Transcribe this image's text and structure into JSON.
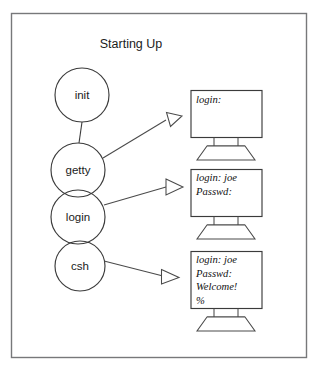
{
  "figure": {
    "title": "Starting Up",
    "background_color": "#ffffff",
    "frame_color": "#77787a",
    "stroke_color": "#3b3b3b"
  },
  "process_chain": {
    "nodes": [
      {
        "id": "init",
        "label": "init",
        "cx": 82,
        "cy": 95,
        "r": 27
      },
      {
        "id": "getty",
        "label": "getty",
        "cx": 78,
        "cy": 170,
        "r": 27
      },
      {
        "id": "login",
        "label": "login",
        "cx": 78,
        "cy": 217,
        "r": 27
      },
      {
        "id": "csh",
        "label": "csh",
        "cx": 80,
        "cy": 266,
        "r": 25
      }
    ],
    "connector": {
      "from": "init",
      "to": "getty"
    }
  },
  "terminals": [
    {
      "id": "terminal-login-prompt",
      "source_node": "getty",
      "lines": [
        "login:"
      ]
    },
    {
      "id": "terminal-password-prompt",
      "source_node": "login",
      "lines": [
        "login: joe",
        "Passwd:"
      ]
    },
    {
      "id": "terminal-shell-prompt",
      "source_node": "csh",
      "lines": [
        "login: joe",
        "Passwd:",
        "Welcome!",
        "%"
      ]
    }
  ],
  "arrows": [
    {
      "id": "arrow-getty-to-terminal-1",
      "from": "getty",
      "to": "terminal-login-prompt",
      "direction": "up-right"
    },
    {
      "id": "arrow-login-to-terminal-2",
      "from": "login",
      "to": "terminal-password-prompt",
      "direction": "right"
    },
    {
      "id": "arrow-csh-to-terminal-3",
      "from": "csh",
      "to": "terminal-shell-prompt",
      "direction": "down-right"
    }
  ]
}
